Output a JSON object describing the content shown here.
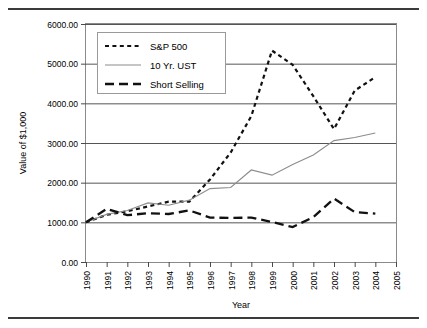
{
  "figure": {
    "has_top_rule": true,
    "has_bottom_rule": true
  },
  "chart_data": {
    "type": "line",
    "title": "",
    "xlabel": "Year",
    "ylabel": "Value of $1,000",
    "xlim": [
      1990,
      2005
    ],
    "ylim": [
      0,
      6000
    ],
    "grid": true,
    "legend_position": "top-left",
    "x_tick_labels": [
      "1990",
      "1991",
      "1992",
      "1993",
      "1994",
      "1995",
      "1996",
      "1997",
      "1998",
      "1999",
      "2000",
      "2001",
      "2002",
      "2003",
      "2004",
      "2005"
    ],
    "y_tick_labels": [
      "0.00",
      "1000.00",
      "2000.00",
      "3000.00",
      "4000.00",
      "5000.00",
      "6000.00"
    ],
    "y_ticks": [
      0,
      1000,
      2000,
      3000,
      4000,
      5000,
      6000
    ],
    "x": [
      1990,
      1991,
      1992,
      1993,
      1994,
      1995,
      1996,
      1997,
      1998,
      1999,
      2000,
      2001,
      2002,
      2003,
      2004
    ],
    "series": [
      {
        "name": "S&P 500",
        "style": "short-dash",
        "color": "#111111",
        "values": [
          1000,
          1190,
          1280,
          1400,
          1520,
          1520,
          2080,
          2760,
          3680,
          5330,
          4970,
          4180,
          3350,
          4320,
          4660
        ]
      },
      {
        "name": "10 Yr. UST",
        "style": "thin-solid",
        "color": "#8c8c8c",
        "values": [
          1000,
          1200,
          1300,
          1490,
          1430,
          1560,
          1850,
          1880,
          2320,
          2190,
          2460,
          2700,
          3060,
          3140,
          3250
        ]
      },
      {
        "name": "Short Selling",
        "style": "long-dash",
        "color": "#111111",
        "values": [
          1000,
          1340,
          1180,
          1230,
          1210,
          1300,
          1120,
          1110,
          1120,
          1010,
          880,
          1130,
          1600,
          1260,
          1220
        ]
      }
    ]
  }
}
